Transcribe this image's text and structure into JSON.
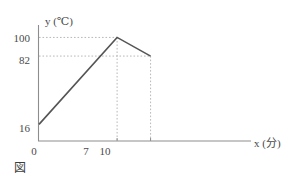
{
  "figure": {
    "caption": "図",
    "y_axis_title_var": "y",
    "y_axis_title_unit": "(℃)",
    "x_axis_title_var": "x",
    "x_axis_title_unit": "(分)"
  },
  "chart_data": {
    "type": "line",
    "title": "",
    "subtitle": "",
    "xlabel": "x (分)",
    "ylabel": "y (℃)",
    "x": [
      0,
      7,
      10
    ],
    "values": [
      16,
      100,
      82
    ],
    "series": [
      {
        "name": "temperature",
        "points": [
          {
            "x": 0,
            "y": 16
          },
          {
            "x": 7,
            "y": 100
          },
          {
            "x": 10,
            "y": 82
          }
        ]
      }
    ],
    "x_tick_labels": [
      "0",
      "7",
      "10"
    ],
    "y_tick_labels": [
      "16",
      "82",
      "100"
    ],
    "origin_label": "0",
    "xlim": [
      0,
      19
    ],
    "ylim": [
      0,
      112
    ],
    "grid": false,
    "guide_lines": [
      {
        "type": "horizontal",
        "value": 100,
        "to_x": 7,
        "style": "dotted"
      },
      {
        "type": "horizontal",
        "value": 82,
        "to_x": 10,
        "style": "dotted"
      },
      {
        "type": "vertical",
        "value": 7,
        "to_y": 100,
        "style": "dotted"
      },
      {
        "type": "vertical",
        "value": 10,
        "to_y": 82,
        "style": "dotted"
      }
    ],
    "legend": [],
    "legend_position": "none",
    "colors": {
      "line": "#555555",
      "axis": "#8d8d8d",
      "guide": "#b8b8b8",
      "text": "#4a4a4a",
      "background": "#ffffff"
    }
  }
}
